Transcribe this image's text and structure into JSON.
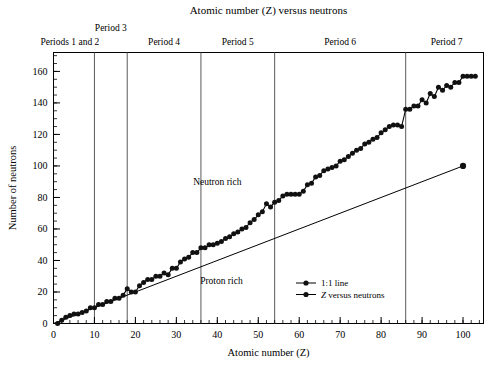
{
  "chart_data": {
    "type": "scatter",
    "title": "Atomic number (Z) versus neutrons",
    "xlabel": "Atomic number (Z)",
    "ylabel": "Number of neutrons",
    "xlim": [
      0,
      105
    ],
    "ylim": [
      0,
      172
    ],
    "grid": false,
    "legend_position": "inside-lower-right",
    "x_ticks": [
      0,
      10,
      20,
      30,
      40,
      50,
      60,
      70,
      80,
      90,
      100
    ],
    "x_tick_labels": [
      "0",
      "10",
      "20",
      "30",
      "40",
      "50",
      "60",
      "70",
      "80",
      "90",
      "100"
    ],
    "x_minor_step": 2,
    "y_ticks": [
      0,
      20,
      40,
      60,
      80,
      100,
      120,
      140,
      160
    ],
    "y_tick_labels": [
      "0",
      "20",
      "40",
      "60",
      "80",
      "100",
      "120",
      "140",
      "160"
    ],
    "y_minor_step": 5,
    "legend": [
      {
        "label": "1:1 line",
        "marker": "filled-circle",
        "line": true,
        "italic_prefix": ""
      },
      {
        "label": "Z versus neutrons",
        "marker": "filled-circle",
        "line": true,
        "italic_prefix": "Z"
      }
    ],
    "annotations": [
      {
        "text": "Neutron rich",
        "x": 40,
        "y": 88
      },
      {
        "text": "Proton rich",
        "x": 41,
        "y": 25
      }
    ],
    "period_dividers": [
      {
        "z": 10,
        "label": ""
      },
      {
        "z": 18,
        "label": ""
      },
      {
        "z": 36,
        "label": ""
      },
      {
        "z": 54,
        "label": ""
      },
      {
        "z": 86,
        "label": ""
      }
    ],
    "period_labels": [
      {
        "text": "Periods 1 and 2",
        "z_center": 4,
        "row": 1
      },
      {
        "text": "Period 3",
        "z_center": 14,
        "row": 0
      },
      {
        "text": "Period 4",
        "z_center": 27,
        "row": 1
      },
      {
        "text": "Period 5",
        "z_center": 45,
        "row": 1
      },
      {
        "text": "Period 6",
        "z_center": 70,
        "row": 1
      },
      {
        "text": "Period 7",
        "z_center": 96,
        "row": 1
      }
    ],
    "series": [
      {
        "name": "1:1 line",
        "type": "line-with-endpoint",
        "x": [
          0,
          100
        ],
        "values": [
          0,
          100
        ],
        "endpoint_marker": true
      },
      {
        "name": "Z versus neutrons",
        "type": "scatter-line",
        "x": [
          1,
          2,
          3,
          4,
          5,
          6,
          7,
          8,
          9,
          10,
          11,
          12,
          13,
          14,
          15,
          16,
          17,
          18,
          19,
          20,
          21,
          22,
          23,
          24,
          25,
          26,
          27,
          28,
          29,
          30,
          31,
          32,
          33,
          34,
          35,
          36,
          37,
          38,
          39,
          40,
          41,
          42,
          43,
          44,
          45,
          46,
          47,
          48,
          49,
          50,
          51,
          52,
          53,
          54,
          55,
          56,
          57,
          58,
          59,
          60,
          61,
          62,
          63,
          64,
          65,
          66,
          67,
          68,
          69,
          70,
          71,
          72,
          73,
          74,
          75,
          76,
          77,
          78,
          79,
          80,
          81,
          82,
          83,
          84,
          85,
          86,
          87,
          88,
          89,
          90,
          91,
          92,
          93,
          94,
          95,
          96,
          97,
          98,
          99,
          100,
          101,
          102,
          103
        ],
        "values": [
          0,
          2,
          4,
          5,
          6,
          6,
          7,
          8,
          10,
          10,
          12,
          12,
          14,
          14,
          16,
          16,
          18,
          22,
          20,
          20,
          24,
          26,
          28,
          28,
          30,
          30,
          32,
          31,
          35,
          35,
          39,
          41,
          42,
          45,
          45,
          48,
          48,
          50,
          50,
          51,
          52,
          54,
          55,
          57,
          58,
          60,
          61,
          64,
          66,
          69,
          71,
          76,
          74,
          77,
          78,
          81,
          82,
          82,
          82,
          82,
          84,
          88,
          89,
          93,
          94,
          97,
          98,
          99,
          100,
          103,
          104,
          106,
          108,
          110,
          111,
          114,
          115,
          117,
          118,
          121,
          123,
          125,
          126,
          126,
          125,
          136,
          136,
          138,
          138,
          142,
          140,
          146,
          144,
          150,
          148,
          151,
          150,
          153,
          153,
          157,
          157,
          157,
          157
        ]
      }
    ]
  }
}
